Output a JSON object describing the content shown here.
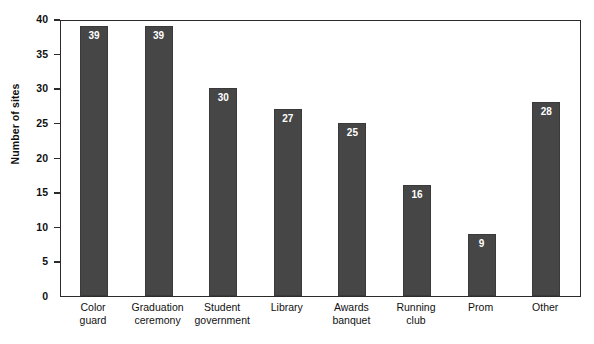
{
  "chart_data": {
    "type": "bar",
    "title": "",
    "xlabel": "",
    "ylabel": "Number of sites",
    "ylim": [
      0,
      40
    ],
    "yticks": [
      0,
      5,
      10,
      15,
      20,
      25,
      30,
      35,
      40
    ],
    "grid": false,
    "legend": null,
    "bar_color": "#464646",
    "value_label_color": "#ffffff",
    "categories": [
      "Color guard",
      "Graduation ceremony",
      "Student government",
      "Library",
      "Awards banquet",
      "Running club",
      "Prom",
      "Other"
    ],
    "values": [
      39,
      39,
      30,
      27,
      25,
      16,
      9,
      28
    ],
    "bars": [
      {
        "line1": "Color",
        "line2": "guard",
        "value": 39
      },
      {
        "line1": "Graduation",
        "line2": "ceremony",
        "value": 39
      },
      {
        "line1": "Student",
        "line2": "government",
        "value": 30
      },
      {
        "line1": "Library",
        "line2": "",
        "value": 27
      },
      {
        "line1": "Awards",
        "line2": "banquet",
        "value": 25
      },
      {
        "line1": "Running",
        "line2": "club",
        "value": 16
      },
      {
        "line1": "Prom",
        "line2": "",
        "value": 9
      },
      {
        "line1": "Other",
        "line2": "",
        "value": 28
      }
    ]
  },
  "caption": {
    "text": ""
  }
}
